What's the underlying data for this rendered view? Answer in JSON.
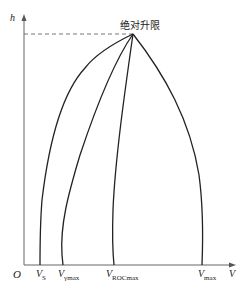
{
  "diagram": {
    "title_label": "绝对升限",
    "axes": {
      "y_label": "h",
      "x_label": "V",
      "origin_label": "O"
    },
    "curves": [
      {
        "name": "V_S",
        "label_main": "V",
        "label_sub": "S"
      },
      {
        "name": "V_gamma_max",
        "label_main": "V",
        "label_sub": "γmax"
      },
      {
        "name": "V_ROC_max",
        "label_main": "V",
        "label_sub": "ROCmax"
      },
      {
        "name": "V_max",
        "label_main": "V",
        "label_sub": "max"
      }
    ],
    "colors": {
      "line": "#222222",
      "axis": "#555555",
      "dash": "#555555"
    }
  }
}
